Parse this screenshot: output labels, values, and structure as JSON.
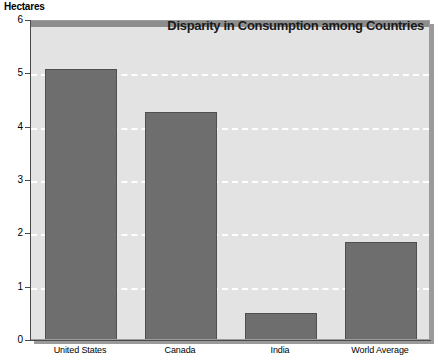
{
  "chart_data": {
    "type": "bar",
    "title": "Disparity in Consumption among Countries",
    "xlabel": "",
    "ylabel": "Hectares",
    "categories": [
      "United States",
      "Canada",
      "India",
      "World Average"
    ],
    "values": [
      5.1,
      4.3,
      0.52,
      1.85
    ],
    "ylim": [
      0,
      6
    ],
    "yticks": [
      0,
      1,
      2,
      3,
      4,
      5,
      6
    ],
    "ytick_labels": [
      "0",
      "1",
      "2",
      "3",
      "4",
      "5",
      "6"
    ],
    "grid": true,
    "grid_axis": "y",
    "grid_style": "dashed",
    "grid_color": "#ffffff",
    "legend": false,
    "bar_color": "#6e6e6e",
    "bar_edge_color": "#4f4f4f",
    "plot_background": "#e3e3e3",
    "page_background": "#ffffff",
    "axis_color": "#4a4a4a",
    "title_color": "#1a1a1a"
  }
}
